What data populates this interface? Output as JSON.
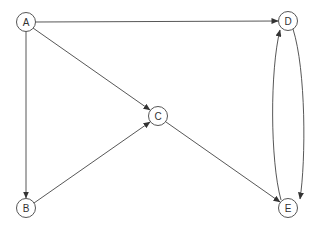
{
  "diagram": {
    "type": "directed-graph",
    "nodes": [
      {
        "id": "A",
        "label": "A",
        "x": 26,
        "y": 22
      },
      {
        "id": "B",
        "label": "B",
        "x": 26,
        "y": 208
      },
      {
        "id": "C",
        "label": "C",
        "x": 158,
        "y": 116
      },
      {
        "id": "D",
        "label": "D",
        "x": 288,
        "y": 21
      },
      {
        "id": "E",
        "label": "E",
        "x": 288,
        "y": 208
      }
    ],
    "edges": [
      {
        "from": "A",
        "to": "D"
      },
      {
        "from": "A",
        "to": "C"
      },
      {
        "from": "A",
        "to": "B"
      },
      {
        "from": "B",
        "to": "C"
      },
      {
        "from": "C",
        "to": "E"
      },
      {
        "from": "D",
        "to": "E"
      },
      {
        "from": "E",
        "to": "D"
      }
    ],
    "colors": {
      "stroke": "#444444",
      "node_fill": "#ffffff",
      "text": "#333333"
    }
  }
}
